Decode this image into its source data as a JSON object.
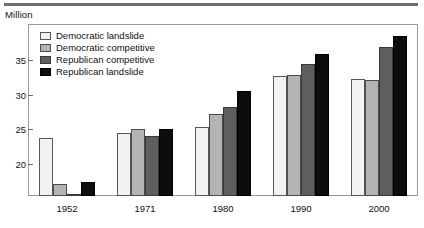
{
  "header": {
    "unit_label": "Million"
  },
  "legend": {
    "position": "top-left-inside",
    "entries": [
      {
        "label": "Democratic landslide",
        "color": "#f2f2f2"
      },
      {
        "label": "Democratic competitive",
        "color": "#b4b4b4"
      },
      {
        "label": "Republican competitive",
        "color": "#5e5e5e"
      },
      {
        "label": "Republican landslide",
        "color": "#0d0d0d"
      }
    ]
  },
  "chart_data": {
    "type": "bar",
    "title": "",
    "subtitle": "",
    "xlabel": "",
    "ylabel": "Million",
    "categories": [
      "1952",
      "1971",
      "1980",
      "1990",
      "2000"
    ],
    "series": [
      {
        "name": "Democratic landslide",
        "color": "#f2f2f2",
        "values": [
          23.7,
          24.4,
          25.4,
          32.7,
          32.3
        ]
      },
      {
        "name": "Democratic competitive",
        "color": "#b4b4b4",
        "values": [
          17.0,
          25.0,
          27.2,
          32.9,
          32.2
        ]
      },
      {
        "name": "Republican competitive",
        "color": "#5e5e5e",
        "values": [
          15.6,
          24.0,
          28.2,
          34.5,
          37.0
        ]
      },
      {
        "name": "Republican landslide",
        "color": "#0d0d0d",
        "values": [
          17.3,
          25.0,
          30.6,
          36.0,
          38.6
        ]
      }
    ],
    "yticks": [
      20,
      25,
      30,
      35
    ],
    "ylim": [
      15.3,
      40.3
    ],
    "grid": false,
    "legend_position": "inside top-left"
  }
}
